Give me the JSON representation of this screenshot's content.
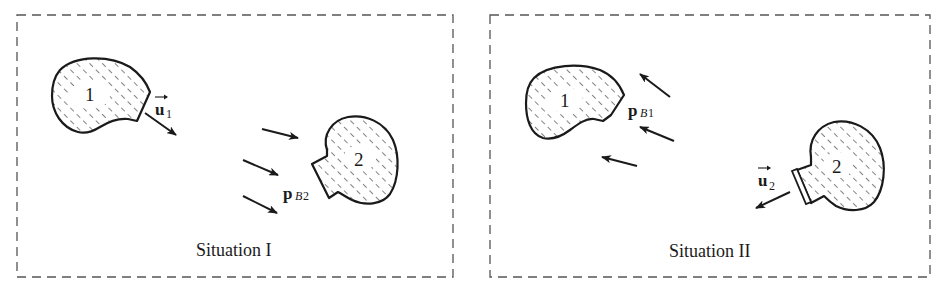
{
  "panels": [
    {
      "caption": "Situation I",
      "bodies": [
        {
          "label": "1"
        },
        {
          "label": "2"
        }
      ],
      "velocity_label": {
        "symbol": "u",
        "subscript": "1"
      },
      "momentum_label": {
        "symbol": "p",
        "subscript_letter": "B",
        "subscript_number": "2"
      }
    },
    {
      "caption": "Situation II",
      "bodies": [
        {
          "label": "1"
        },
        {
          "label": "2"
        }
      ],
      "velocity_label": {
        "symbol": "u",
        "subscript": "2"
      },
      "momentum_label": {
        "symbol": "p",
        "subscript_letter": "B",
        "subscript_number": "1"
      }
    }
  ],
  "colors": {
    "ink": "#1a1a1a",
    "border": "#555555",
    "background": "#ffffff"
  }
}
